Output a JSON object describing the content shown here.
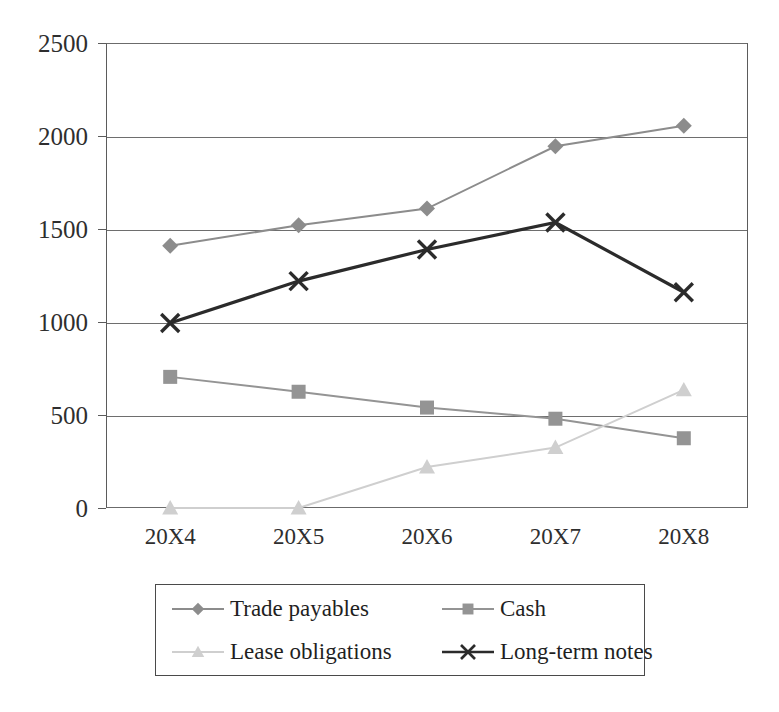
{
  "chart_data": {
    "type": "line",
    "title": "",
    "xlabel": "",
    "ylabel": "",
    "categories": [
      "20X4",
      "20X5",
      "20X6",
      "20X7",
      "20X8"
    ],
    "ylim": [
      0,
      2500
    ],
    "ytick_values": [
      2500,
      2000,
      1500,
      1000,
      500,
      0
    ],
    "ytick_labels": [
      "2500",
      "2000",
      "1500",
      "1000",
      "500",
      "0"
    ],
    "grid": true,
    "legend_position": "bottom",
    "series": [
      {
        "name": "Trade payables",
        "marker": "diamond",
        "color": "#8c8c8c",
        "values": [
          1410,
          1520,
          1610,
          1945,
          2055
        ]
      },
      {
        "name": "Cash",
        "marker": "square",
        "color": "#949494",
        "values": [
          705,
          625,
          540,
          480,
          375
        ]
      },
      {
        "name": "Lease obligations",
        "marker": "triangle",
        "color": "#cfcfcf",
        "values": [
          0,
          0,
          220,
          325,
          635
        ]
      },
      {
        "name": "Long-term notes",
        "marker": "x",
        "color": "#2b2b2b",
        "values": [
          995,
          1220,
          1390,
          1535,
          1160
        ]
      }
    ]
  },
  "axis": {
    "y_ticks": [
      {
        "label": "2500"
      },
      {
        "label": "2000"
      },
      {
        "label": "1500"
      },
      {
        "label": "1000"
      },
      {
        "label": "500"
      },
      {
        "label": "0"
      }
    ],
    "x_ticks": [
      {
        "label": "20X4"
      },
      {
        "label": "20X5"
      },
      {
        "label": "20X6"
      },
      {
        "label": "20X7"
      },
      {
        "label": "20X8"
      }
    ]
  },
  "legend": {
    "items": [
      {
        "label": "Trade payables",
        "marker": "diamond-marker",
        "color": "#8c8c8c"
      },
      {
        "label": "Cash",
        "marker": "square-marker",
        "color": "#949494"
      },
      {
        "label": "Lease obligations",
        "marker": "triangle-marker",
        "color": "#cfcfcf"
      },
      {
        "label": "Long-term notes",
        "marker": "x-marker",
        "color": "#2b2b2b"
      }
    ]
  }
}
